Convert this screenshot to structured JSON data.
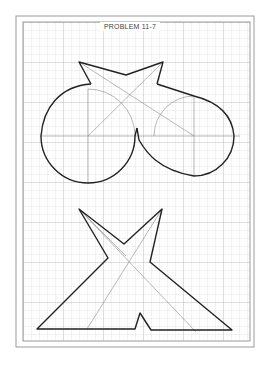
{
  "title": "PROBLEM 11-7",
  "colors": {
    "background": "#ffffff",
    "grid": "#d0d0d0",
    "grid_major": "#b8b8b8",
    "frame": "#9a9a9a",
    "outline": "#222222",
    "construction": "#888888"
  },
  "figures": [
    {
      "name": "upper-figure",
      "description": "Two circles joined by tangent arcs with a star-shaped top"
    },
    {
      "name": "lower-figure",
      "description": "X-shaped figure on a triangular base with a notch"
    }
  ]
}
